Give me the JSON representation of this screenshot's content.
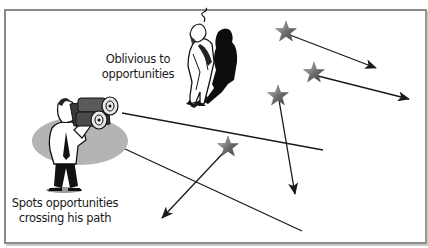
{
  "figure": {
    "labels": {
      "oblivious_line1": "Oblivious to",
      "oblivious_line2": "opportunities",
      "spots_line1": "Spots opportunities",
      "spots_line2": "crossing his path"
    },
    "figures": [
      {
        "name": "oblivious-man",
        "description": "Man looking upward, unaware, with shadow"
      },
      {
        "name": "binocular-man",
        "description": "Man looking through binoculars at passing opportunities"
      }
    ],
    "stars": [
      {
        "id": 1,
        "x": 286,
        "y": 32,
        "arrow_to": [
          376,
          68
        ]
      },
      {
        "id": 2,
        "x": 314,
        "y": 73,
        "arrow_to": [
          409,
          99
        ]
      },
      {
        "id": 3,
        "x": 278,
        "y": 96,
        "arrow_to": [
          295,
          194
        ]
      },
      {
        "id": 4,
        "x": 228,
        "y": 147,
        "arrow_to": [
          162,
          218
        ]
      }
    ],
    "sight_lines": [
      {
        "from": [
          122,
          113
        ],
        "to": [
          323,
          150
        ]
      },
      {
        "from": [
          110,
          142
        ],
        "to": [
          302,
          231
        ]
      }
    ],
    "colors": {
      "border": "#8a8a8a",
      "star_dark": "#5a5a5a",
      "star_light": "#b8b8b8",
      "ellipse": "#b4b4b4",
      "line": "#1a1a1a"
    }
  }
}
